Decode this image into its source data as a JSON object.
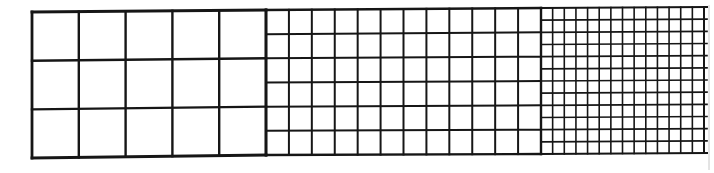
{
  "figure": {
    "line_color": "#161616",
    "background": "#ffffff",
    "grids": [
      {
        "name": "coarse-grid",
        "cols": 5,
        "rows": 3,
        "x0": 32,
        "x1": 266,
        "top_left": 12,
        "top_right": 10,
        "bottom_left": 158,
        "bottom_right": 155,
        "stroke": 2.4
      },
      {
        "name": "medium-grid",
        "cols": 12,
        "rows": 6,
        "x0": 266,
        "x1": 541,
        "top_left": 10,
        "top_right": 8,
        "bottom_left": 155,
        "bottom_right": 154,
        "stroke": 2.0
      },
      {
        "name": "fine-grid",
        "cols": 14,
        "rows": 12,
        "x0": 541,
        "x1": 704,
        "top_left": 8,
        "top_right": 7,
        "bottom_left": 154,
        "bottom_right": 153,
        "stroke": 1.6,
        "h_overhang": 3
      }
    ]
  }
}
